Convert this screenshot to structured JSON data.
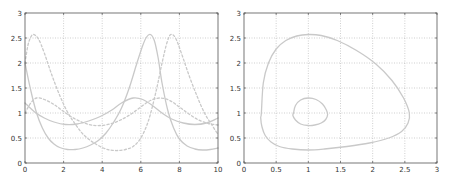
{
  "figure": {
    "width": 450,
    "height": 179,
    "background": "#ffffff"
  },
  "style": {
    "line_color": "#c9c9c9",
    "axis_color": "#555555",
    "grid_color": "#b0b0b0",
    "line_width": 1.3
  },
  "chart_data": [
    {
      "type": "line",
      "title": "",
      "xlabel": "",
      "ylabel": "",
      "xlim": [
        0,
        10
      ],
      "ylim": [
        0,
        3
      ],
      "grid": true,
      "legend": null,
      "plot_box": {
        "left": 25,
        "top": 13,
        "right": 218,
        "bottom": 163
      },
      "xticks": [
        0,
        2,
        4,
        6,
        8,
        10
      ],
      "xtick_labels": [
        "0",
        "2",
        "4",
        "6",
        "8",
        "10"
      ],
      "yticks": [
        0,
        0.5,
        1,
        1.5,
        2,
        2.5,
        3
      ],
      "ytick_labels": [
        "0",
        "0.5",
        "1",
        "1.5",
        "2",
        "2.5",
        "3"
      ],
      "series": [
        {
          "name": "x (large orbit)",
          "style": "solid",
          "x": [
            0,
            0.3,
            0.6,
            0.9,
            1.2,
            1.5,
            1.8,
            2.2,
            2.6,
            3.0,
            3.4,
            3.8,
            4.2,
            4.6,
            5.0,
            5.4,
            5.8,
            6.1,
            6.3,
            6.5,
            6.7,
            6.9,
            7.1,
            7.4,
            7.7,
            8.0,
            8.4,
            8.8,
            9.2,
            9.6,
            10
          ],
          "y": [
            2.0,
            1.45,
            1.0,
            0.7,
            0.5,
            0.38,
            0.31,
            0.27,
            0.27,
            0.3,
            0.36,
            0.45,
            0.6,
            0.82,
            1.1,
            1.5,
            2.0,
            2.35,
            2.52,
            2.57,
            2.45,
            2.1,
            1.6,
            1.05,
            0.7,
            0.48,
            0.34,
            0.28,
            0.26,
            0.27,
            0.3
          ]
        },
        {
          "name": "y (large orbit)",
          "style": "dashed",
          "x": [
            0,
            0.15,
            0.3,
            0.45,
            0.7,
            1.0,
            1.4,
            1.8,
            2.2,
            2.6,
            3.0,
            3.5,
            4.0,
            4.4,
            4.8,
            5.2,
            5.6,
            6.0,
            6.4,
            6.8,
            7.1,
            7.35,
            7.55,
            7.8,
            8.1,
            8.5,
            8.9,
            9.3,
            9.7,
            10
          ],
          "y": [
            2.0,
            2.35,
            2.52,
            2.57,
            2.48,
            2.2,
            1.75,
            1.35,
            1.02,
            0.78,
            0.58,
            0.42,
            0.31,
            0.26,
            0.25,
            0.27,
            0.33,
            0.5,
            0.85,
            1.45,
            2.0,
            2.4,
            2.57,
            2.5,
            2.2,
            1.75,
            1.35,
            1.0,
            0.75,
            0.57
          ]
        },
        {
          "name": "x (small orbit)",
          "style": "solid",
          "x": [
            0,
            0.5,
            1.0,
            1.5,
            2.1,
            2.7,
            3.3,
            3.9,
            4.5,
            5.0,
            5.6,
            6.1,
            6.6,
            7.1,
            7.6,
            8.2,
            8.8,
            9.4,
            10
          ],
          "y": [
            1.2,
            1.02,
            0.9,
            0.82,
            0.77,
            0.78,
            0.84,
            0.93,
            1.06,
            1.2,
            1.3,
            1.27,
            1.15,
            1.0,
            0.88,
            0.8,
            0.77,
            0.8,
            0.9
          ]
        },
        {
          "name": "y (small orbit)",
          "style": "dashed",
          "x": [
            0,
            0.3,
            0.6,
            1.0,
            1.5,
            2.0,
            2.6,
            3.3,
            3.9,
            4.5,
            5.0,
            5.5,
            6.0,
            6.5,
            7.0,
            7.5,
            8.0,
            8.5,
            9.0,
            9.5,
            10
          ],
          "y": [
            1.0,
            1.2,
            1.3,
            1.27,
            1.17,
            1.03,
            0.88,
            0.77,
            0.75,
            0.79,
            0.87,
            0.98,
            1.12,
            1.25,
            1.3,
            1.25,
            1.12,
            0.98,
            0.86,
            0.79,
            0.76
          ]
        }
      ]
    },
    {
      "type": "line",
      "title": "",
      "xlabel": "",
      "ylabel": "",
      "xlim": [
        0,
        3
      ],
      "ylim": [
        0,
        3
      ],
      "grid": true,
      "legend": null,
      "plot_box": {
        "left": 244,
        "top": 13,
        "right": 437,
        "bottom": 163
      },
      "xticks": [
        0,
        0.5,
        1,
        1.5,
        2,
        2.5,
        3
      ],
      "xtick_labels": [
        "0",
        "0.5",
        "1",
        "1.5",
        "2",
        "2.5",
        "3"
      ],
      "yticks": [
        0,
        0.5,
        1,
        1.5,
        2,
        2.5,
        3
      ],
      "ytick_labels": [
        "0",
        "0.5",
        "1",
        "1.5",
        "2",
        "2.5",
        "3"
      ],
      "series": [
        {
          "name": "phase orbit (large)",
          "style": "solid",
          "closed": true,
          "x": [
            0.27,
            0.3,
            0.38,
            0.5,
            0.65,
            0.82,
            1.0,
            1.2,
            1.45,
            1.75,
            2.05,
            2.3,
            2.48,
            2.57,
            2.55,
            2.45,
            2.25,
            1.95,
            1.6,
            1.25,
            1.0,
            0.75,
            0.55,
            0.42,
            0.33,
            0.28,
            0.26
          ],
          "y": [
            1.0,
            1.6,
            2.0,
            2.28,
            2.45,
            2.54,
            2.57,
            2.55,
            2.45,
            2.25,
            1.98,
            1.65,
            1.3,
            1.0,
            0.8,
            0.63,
            0.5,
            0.4,
            0.33,
            0.28,
            0.26,
            0.28,
            0.33,
            0.42,
            0.55,
            0.72,
            0.9
          ]
        },
        {
          "name": "phase orbit (small)",
          "style": "solid",
          "closed": true,
          "x": [
            0.77,
            0.8,
            0.88,
            1.0,
            1.12,
            1.22,
            1.28,
            1.3,
            1.27,
            1.2,
            1.1,
            1.0,
            0.88,
            0.8,
            0.76
          ],
          "y": [
            1.0,
            1.15,
            1.26,
            1.3,
            1.27,
            1.18,
            1.06,
            0.97,
            0.87,
            0.8,
            0.76,
            0.75,
            0.78,
            0.86,
            0.95
          ]
        }
      ]
    }
  ]
}
